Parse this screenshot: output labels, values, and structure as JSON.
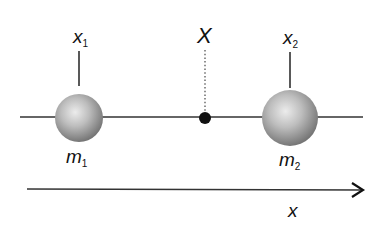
{
  "diagram": {
    "type": "center-of-mass",
    "labels": {
      "x1_base": "x",
      "x1_sub": "1",
      "x2_base": "x",
      "x2_sub": "2",
      "center": "X",
      "m1_base": "m",
      "m1_sub": "1",
      "m2_base": "m",
      "m2_sub": "2",
      "axis": "x"
    },
    "colors": {
      "line": "#333333",
      "sphere_light": "#e6e6e6",
      "sphere_dark": "#7a7a7a",
      "dot": "#111111",
      "text": "#111111"
    },
    "elements": {
      "mass1": {
        "cx": 79,
        "cy": 118,
        "r": 24
      },
      "mass2": {
        "cx": 290,
        "cy": 118,
        "r": 28
      },
      "center_of_mass": {
        "cx": 205,
        "cy": 118,
        "r": 6
      },
      "rod": {
        "x1": 20,
        "x2": 363,
        "y": 117
      },
      "axis_arrow": {
        "x1": 27,
        "x2": 363,
        "y": 189
      }
    }
  }
}
